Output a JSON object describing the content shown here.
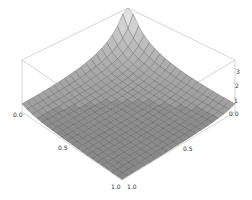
{
  "chart_data": {
    "type": "surface3d",
    "title": "",
    "xlabel": "",
    "ylabel": "",
    "zlabel": "",
    "function_description": "Surface that rises steeply toward the back corner (x=0, y=0) and flattens near z≈0 elsewhere; resembles z = c/((x)(y)) clipped at top",
    "x_range": [
      0.0,
      1.0
    ],
    "y_range": [
      0.0,
      1.0
    ],
    "z_range": [
      0,
      3.6
    ],
    "x_ticks": [
      "0.0",
      "0.5",
      "1.0"
    ],
    "y_ticks": [
      "1.0",
      "0.5",
      "0.0"
    ],
    "z_ticks": [
      "1",
      "2",
      "3"
    ],
    "mesh_lines": 20,
    "box": true,
    "colors": {
      "surface_light": "#e6e6e6",
      "surface_dark": "#6e6e6e",
      "mesh": "#3a3a3a",
      "box": "#b8b8b8"
    }
  },
  "axes": {
    "left_axis_labels": [
      "0.0",
      "0.5",
      "1.0"
    ],
    "right_axis_labels": [
      "1.0",
      "0.5",
      "0.0"
    ],
    "vertical_axis_labels": [
      "1",
      "2",
      "3"
    ]
  }
}
